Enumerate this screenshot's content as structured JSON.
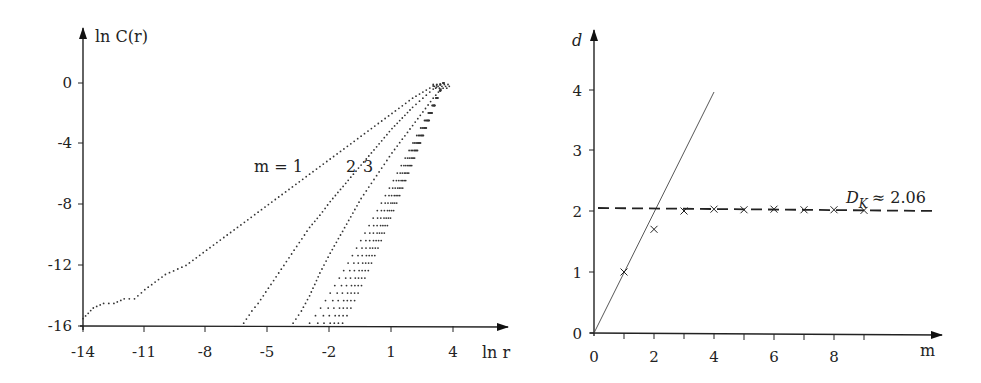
{
  "chart_data": [
    {
      "type": "scatter",
      "title": "",
      "xlabel": "ln r",
      "ylabel": "ln C(r)",
      "xlim": [
        -14,
        6
      ],
      "ylim": [
        -16,
        2
      ],
      "xticks": [
        -14,
        -11,
        -8,
        -5,
        -2,
        1,
        4
      ],
      "yticks": [
        0,
        -4,
        -8,
        -12,
        -16
      ],
      "grid": false,
      "annotations": [
        {
          "text": "m = 1",
          "x": -4.3,
          "y": -5.5
        },
        {
          "text": "2",
          "x": -0.3,
          "y": -5.5
        },
        {
          "text": "3",
          "x": 0.5,
          "y": -5.5
        }
      ],
      "series": [
        {
          "name": "m = 1",
          "x": [
            -14,
            -13.5,
            -13,
            -12.5,
            -12,
            -11.5,
            -11,
            -10,
            -9,
            -8,
            -7,
            -6,
            -5,
            -4,
            -3,
            -2,
            -1,
            0,
            1,
            2,
            3,
            3.5
          ],
          "y": [
            -15.5,
            -14.8,
            -14.5,
            -14.5,
            -14.2,
            -14.2,
            -13.6,
            -12.6,
            -12.0,
            -11.0,
            -10.0,
            -9.0,
            -8.0,
            -7.0,
            -6.0,
            -5.0,
            -4.0,
            -3.0,
            -2.0,
            -1.0,
            -0.2,
            0
          ]
        },
        {
          "name": "m = 2",
          "x": [
            -6.2,
            -5.8,
            -5.5,
            -5,
            -4.5,
            -4,
            -3.5,
            -3,
            -2.5,
            -2,
            -1.5,
            -1,
            -0.5,
            0,
            0.5,
            1,
            1.5,
            2,
            2.5,
            3,
            3.5
          ],
          "y": [
            -15.8,
            -15.0,
            -14.5,
            -13.5,
            -12.5,
            -11.5,
            -10.5,
            -9.5,
            -8.7,
            -7.8,
            -7.0,
            -6.2,
            -5.4,
            -4.6,
            -3.8,
            -3.0,
            -2.3,
            -1.6,
            -1.0,
            -0.4,
            0
          ]
        },
        {
          "name": "m = 3",
          "x": [
            -3.8,
            -3.4,
            -3,
            -2.5,
            -2,
            -1.5,
            -1,
            -0.5,
            0,
            0.5,
            1,
            1.5,
            2,
            2.5,
            3,
            3.5
          ],
          "y": [
            -15.8,
            -15.0,
            -14.0,
            -12.5,
            -11.2,
            -10.0,
            -8.8,
            -7.6,
            -6.6,
            -5.6,
            -4.6,
            -3.7,
            -2.8,
            -1.9,
            -1.0,
            -0.2
          ]
        },
        {
          "name": "m = 4..10",
          "note": "successively steeper dotted curves converging near ln r ≈ 3.5, ln C ≈ 0",
          "x_start_at_y_minus_16": [
            -3.0,
            -2.6,
            -2.3,
            -2.0,
            -1.8,
            -1.6,
            -1.4
          ]
        }
      ]
    },
    {
      "type": "scatter",
      "title": "",
      "xlabel": "m",
      "ylabel": "d",
      "xlim": [
        0,
        10.5
      ],
      "ylim": [
        0,
        4.6
      ],
      "xticks": [
        0,
        1,
        2,
        3,
        4,
        5,
        6,
        7,
        8,
        9
      ],
      "xtick_labels": [
        "0",
        "",
        "2",
        "",
        "4",
        "",
        "6",
        "",
        "8",
        ""
      ],
      "yticks": [
        0,
        1,
        2,
        3,
        4
      ],
      "grid": false,
      "series": [
        {
          "name": "estimated d",
          "marker": "x",
          "x": [
            1,
            2,
            3,
            4,
            5,
            6,
            7,
            8,
            9
          ],
          "y": [
            1.0,
            1.7,
            2.0,
            2.03,
            2.02,
            2.03,
            2.02,
            2.02,
            2.01
          ]
        },
        {
          "name": "d = m",
          "style": "solid-line",
          "x": [
            0,
            4
          ],
          "y": [
            0,
            4
          ]
        },
        {
          "name": "D_K ≈ 2.06",
          "style": "dashed-line",
          "x": [
            0,
            11.3
          ],
          "y": [
            2.06,
            2.0
          ]
        }
      ],
      "annotations": [
        {
          "text": "D_K ≈ 2.06",
          "x": 9.5,
          "y": 2.3
        }
      ]
    }
  ],
  "left": {
    "ylabel": "ln C(r)",
    "xlabel": "ln r",
    "yticks": [
      "0",
      "-4",
      "-8",
      "-12",
      "-16"
    ],
    "xticks": [
      "-14",
      "-11",
      "-8",
      "-5",
      "-2",
      "1",
      "4"
    ],
    "label_m1": "m = 1",
    "label_2": "2",
    "label_3": "3"
  },
  "right": {
    "ylabel": "d",
    "xlabel": "m",
    "yticks": [
      "0",
      "1",
      "2",
      "3",
      "4"
    ],
    "xticks": [
      "0",
      "2",
      "4",
      "6",
      "8"
    ],
    "dk_label_main": "D",
    "dk_label_sub": "K",
    "dk_label_rest": "≈ 2.06"
  }
}
